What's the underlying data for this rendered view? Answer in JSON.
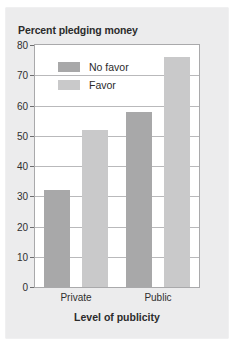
{
  "chart_data": {
    "type": "bar",
    "title": "Percent pledging money",
    "xlabel": "Level of publicity",
    "ylabel": "",
    "categories": [
      "Private",
      "Public"
    ],
    "series": [
      {
        "name": "No favor",
        "values": [
          32,
          58
        ],
        "color": "#a8a8a9"
      },
      {
        "name": "Favor",
        "values": [
          52,
          76
        ],
        "color": "#c9c9ca"
      }
    ],
    "ylim": [
      0,
      80
    ],
    "yticks": [
      0,
      10,
      20,
      30,
      40,
      50,
      60,
      70,
      80
    ],
    "ytick_labels": [
      "0",
      "10",
      "20",
      "30",
      "40",
      "50",
      "60",
      "70",
      "80"
    ],
    "grid": true,
    "legend_position": "upper left",
    "background_color": "#ececed",
    "plot_background_color": "#ffffff",
    "gridline_color": "#b9b9bb",
    "axis_color": "#a9a9ab",
    "text_color": "#2b2b2b"
  }
}
